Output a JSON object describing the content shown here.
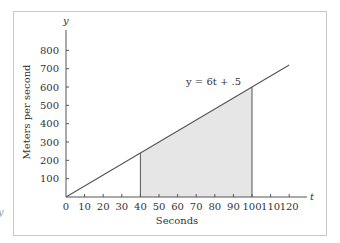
{
  "chart_data": {
    "type": "line",
    "title": "",
    "xlabel": "Seconds",
    "ylabel": "Meters per second",
    "x_var": "t",
    "y_var": "y",
    "xlim": [
      0,
      120
    ],
    "ylim": [
      0,
      800
    ],
    "x_ticks": [
      0,
      10,
      20,
      30,
      40,
      50,
      60,
      70,
      80,
      90,
      100,
      110,
      120
    ],
    "y_ticks": [
      100,
      200,
      300,
      400,
      500,
      600,
      700,
      800
    ],
    "grid": false,
    "legend": null,
    "series": [
      {
        "name": "y = 6t + .5",
        "equation": "y = 6t + .5",
        "x": [
          0,
          120
        ],
        "y": [
          0.5,
          720.5
        ]
      }
    ],
    "shaded_region": {
      "x_from": 40,
      "x_to": 100,
      "y_at_from": 240.5,
      "y_at_to": 600.5,
      "fill": "#e6e6e6"
    },
    "annotations": [
      {
        "text": "y = 6t + .5",
        "x": 74,
        "y": 640
      }
    ]
  },
  "colors": {
    "line": "#555555",
    "axis": "#555555",
    "frame": "#c8c8c8",
    "shade": "#e6e6e6",
    "text": "#333333"
  },
  "stray_glyph": "y"
}
